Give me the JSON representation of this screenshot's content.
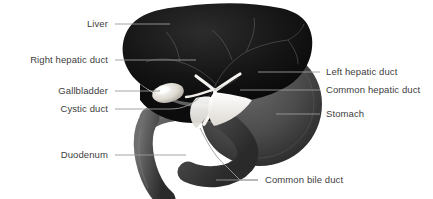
{
  "figure": {
    "background_color": "#ffffff",
    "label_color": "#3d3d3d",
    "leader_color": "#9a9a9a"
  },
  "labels_left": [
    {
      "id": "liver",
      "text": "Liver",
      "x": 110,
      "y": 24,
      "line_to_x": 168,
      "line_to_y": 24
    },
    {
      "id": "right-hepatic-duct",
      "text": "Right hepatic duct",
      "x": 110,
      "y": 60,
      "line_to_x": 176,
      "line_to_y": 60
    },
    {
      "id": "gallbladder",
      "text": "Gallbladder",
      "x": 110,
      "y": 91,
      "line_to_x": 178,
      "line_to_y": 91
    },
    {
      "id": "cystic-duct",
      "text": "Cystic duct",
      "x": 110,
      "y": 109,
      "line_to_x": 186,
      "line_to_y": 103
    },
    {
      "id": "duodenum",
      "text": "Duodenum",
      "x": 110,
      "y": 155,
      "line_to_x": 186,
      "line_to_y": 155
    }
  ],
  "labels_right": [
    {
      "id": "left-hepatic-duct",
      "text": "Left hepatic duct",
      "x": 326,
      "y": 72,
      "line_from_x": 258,
      "line_from_y": 72
    },
    {
      "id": "common-hepatic-duct",
      "text": "Common hepatic duct",
      "x": 326,
      "y": 90,
      "line_from_x": 240,
      "line_from_y": 90
    },
    {
      "id": "stomach",
      "text": "Stomach",
      "x": 326,
      "y": 114,
      "line_from_x": 276,
      "line_from_y": 114
    }
  ],
  "labels_bottom": [
    {
      "id": "common-bile-duct",
      "text": "Common bile duct",
      "x": 265,
      "y": 180,
      "line_from_x": 205,
      "line_from_y": 180
    }
  ],
  "organs": {
    "liver": {
      "name": "Liver",
      "fill": "#151515"
    },
    "stomach": {
      "name": "Stomach",
      "fill": "#4a4a4a"
    },
    "duodenum": {
      "name": "Duodenum",
      "fill": "#4e4e4e"
    },
    "gallbladder": {
      "name": "Gallbladder",
      "fill": "#e9e6e0"
    },
    "ducts": {
      "name": "Bile ducts",
      "fill": "#f4f2ee"
    }
  }
}
